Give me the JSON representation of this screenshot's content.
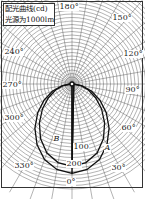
{
  "chart_data": {
    "type": "polar",
    "title": "配光曲线(cd)",
    "subtitle": "光源为1000lm",
    "angle_labels": [
      "0°",
      "30°",
      "60°",
      "90°",
      "120°",
      "150°",
      "180°",
      "240°",
      "270°",
      "300°",
      "330°"
    ],
    "radial_labels": [
      "100",
      "200"
    ],
    "radial_unit": "cd",
    "angular_grid_step_deg": 10,
    "radial_grid_step": 20,
    "radial_max": 300,
    "series": [
      {
        "name": "A",
        "description": "inner elliptical distribution curve",
        "angles_deg": [
          0,
          10,
          20,
          30,
          40,
          50,
          60,
          70,
          80,
          90
        ],
        "values": [
          235,
          228,
          210,
          180,
          145,
          110,
          78,
          50,
          25,
          5
        ]
      },
      {
        "name": "B",
        "description": "outer elliptical distribution curve",
        "angles_deg": [
          0,
          10,
          20,
          30,
          40,
          50,
          60,
          70,
          80,
          90
        ],
        "values": [
          255,
          248,
          230,
          200,
          165,
          128,
          92,
          60,
          30,
          5
        ]
      }
    ],
    "curve_labels": [
      "A",
      "B"
    ],
    "legend_position": "top-left",
    "grid": true
  },
  "colors": {
    "grid": "#444444",
    "curve": "#111111",
    "background": "#ffffff"
  }
}
